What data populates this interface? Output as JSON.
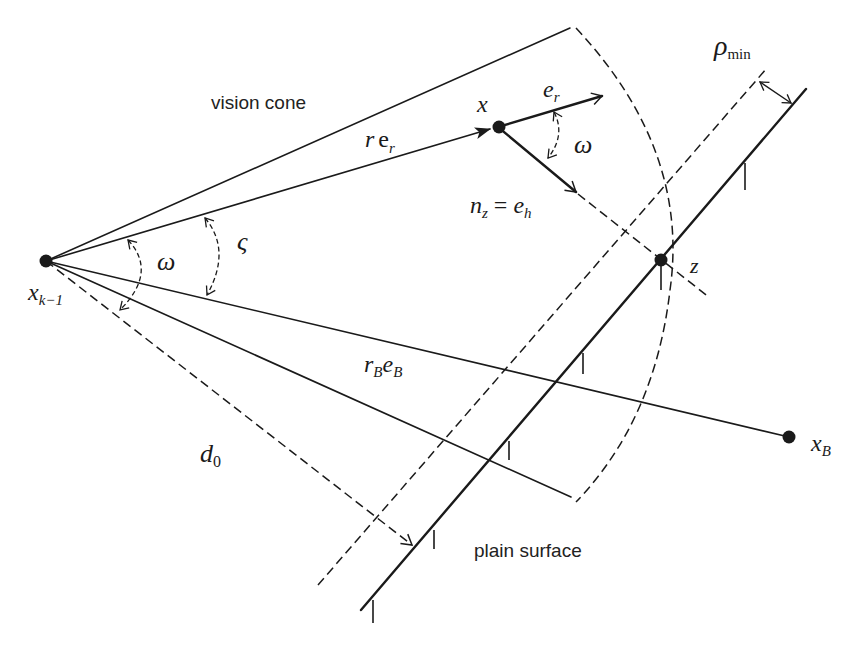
{
  "diagram": {
    "labels": {
      "vision_cone": "vision cone",
      "plain_surface": "plain surface",
      "x_km1_base": "x",
      "x_km1_sub": "k−1",
      "x_point": "x",
      "x_B_base": "x",
      "x_B_sub": "B",
      "z_point": "z",
      "r_er_r": "r",
      "r_er_e": "e",
      "r_er_sub": "r",
      "e_r_base": "e",
      "e_r_sub": "r",
      "n_z_base": "n",
      "n_z_sub": "z",
      "equals": "=",
      "e_h_base": "e",
      "e_h_sub": "h",
      "omega_cone": "ω",
      "omega_vec": "ω",
      "varsigma": "ς",
      "rB_eB_r": "r",
      "rB_eB_rsub": "B",
      "rB_eB_e": "e",
      "rB_eB_esub": "B",
      "d0_base": "d",
      "d0_sub": "0",
      "rho_base": "ρ",
      "rho_sub": "min"
    },
    "points": {
      "x_km1": [
        46,
        261
      ],
      "x": [
        498,
        127
      ],
      "z": [
        661,
        260
      ],
      "x_B": [
        789,
        437
      ]
    },
    "colors": {
      "ink": "#1a1a1a",
      "background": "#ffffff"
    }
  }
}
